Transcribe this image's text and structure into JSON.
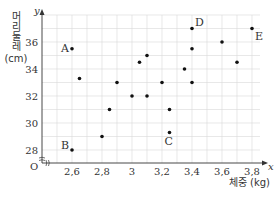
{
  "chart_data": {
    "type": "scatter",
    "title": "",
    "xlabel": "체중 (kg)",
    "ylabel": "머리둘레 (cm)",
    "x_axis_symbol": "x",
    "y_axis_symbol": "y",
    "origin_label": "O",
    "xlim": [
      2.5,
      3.85
    ],
    "ylim": [
      27,
      37.5
    ],
    "x_ticks": [
      "2,6",
      "2,8",
      "3",
      "3,2",
      "3,4",
      "3,6",
      "3,8"
    ],
    "x_tick_values": [
      2.6,
      2.8,
      3.0,
      3.2,
      3.4,
      3.6,
      3.8
    ],
    "y_ticks": [
      "28",
      "30",
      "32",
      "34",
      "36"
    ],
    "y_tick_values": [
      28,
      30,
      32,
      34,
      36
    ],
    "grid": true,
    "points": [
      {
        "x": 2.6,
        "y": 35.5,
        "label": "A"
      },
      {
        "x": 2.6,
        "y": 28,
        "label": "B"
      },
      {
        "x": 3.25,
        "y": 29.3,
        "label": "C"
      },
      {
        "x": 3.4,
        "y": 37,
        "label": "D"
      },
      {
        "x": 3.8,
        "y": 37,
        "label": "E"
      },
      {
        "x": 2.65,
        "y": 33.3,
        "label": ""
      },
      {
        "x": 2.8,
        "y": 29,
        "label": ""
      },
      {
        "x": 2.85,
        "y": 31,
        "label": ""
      },
      {
        "x": 2.9,
        "y": 33,
        "label": ""
      },
      {
        "x": 3.0,
        "y": 32,
        "label": ""
      },
      {
        "x": 3.05,
        "y": 34.5,
        "label": ""
      },
      {
        "x": 3.1,
        "y": 35,
        "label": ""
      },
      {
        "x": 3.1,
        "y": 32,
        "label": ""
      },
      {
        "x": 3.2,
        "y": 33,
        "label": ""
      },
      {
        "x": 3.25,
        "y": 31,
        "label": ""
      },
      {
        "x": 3.35,
        "y": 34,
        "label": ""
      },
      {
        "x": 3.4,
        "y": 35.5,
        "label": ""
      },
      {
        "x": 3.4,
        "y": 33,
        "label": ""
      },
      {
        "x": 3.6,
        "y": 36,
        "label": ""
      },
      {
        "x": 3.7,
        "y": 34.5,
        "label": ""
      }
    ]
  },
  "colors": {
    "grid": "#d9d9d9",
    "axis": "#333333",
    "point": "#111111"
  }
}
